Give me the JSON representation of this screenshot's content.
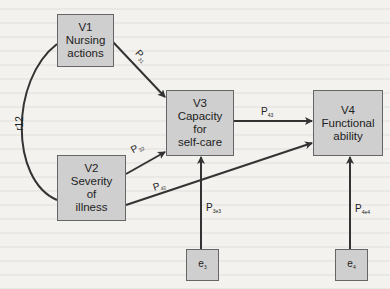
{
  "nodes": {
    "v1": {
      "id": "V1",
      "lines": [
        "V1",
        "Nursing",
        "actions"
      ]
    },
    "v2": {
      "id": "V2",
      "lines": [
        "V2",
        "Severity",
        "of",
        "illness"
      ]
    },
    "v3": {
      "id": "V3",
      "lines": [
        "V3",
        "Capacity",
        "for",
        "self-care"
      ]
    },
    "v4": {
      "id": "V4",
      "lines": [
        "V4",
        "Functional",
        "ability"
      ]
    },
    "e3": {
      "base": "e",
      "sub": "3"
    },
    "e4": {
      "base": "e",
      "sub": "4"
    }
  },
  "edges": {
    "p31": {
      "base": "P",
      "sub": "31",
      "from": "V1",
      "to": "V3"
    },
    "p32": {
      "base": "P",
      "sub": "32",
      "from": "V2",
      "to": "V3"
    },
    "p42": {
      "base": "P",
      "sub": "42",
      "from": "V2",
      "to": "V4"
    },
    "p43": {
      "base": "P",
      "sub": "43",
      "from": "V3",
      "to": "V4"
    },
    "p3e3": {
      "base": "P",
      "sub": "3e3",
      "from": "e3",
      "to": "V3"
    },
    "p4e4": {
      "base": "P",
      "sub": "4e4",
      "from": "e4",
      "to": "V4"
    },
    "r12": {
      "label": "r12",
      "from": "V1",
      "to": "V2"
    }
  },
  "colors": {
    "box_fill": "#cfcfcf",
    "box_border": "#666666",
    "line": "#333333",
    "background": "#f3f2ef"
  }
}
